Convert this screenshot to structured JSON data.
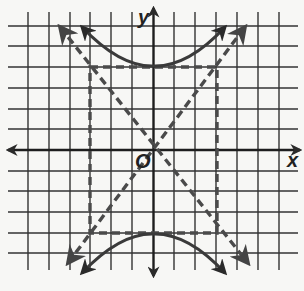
{
  "figure": {
    "type": "hyperbola-graph",
    "axis_labels": {
      "x": "x",
      "y": "y",
      "origin": "O"
    },
    "grid": {
      "x_range": [
        -6,
        7
      ],
      "y_range": [
        -6,
        6
      ],
      "unit": 1
    },
    "hyperbola": {
      "equation": "y^2/16 - x^2/9 = 1",
      "a": 4,
      "b": 3,
      "vertices": [
        [
          0,
          4
        ],
        [
          0,
          -4
        ]
      ],
      "opens": "vertical"
    },
    "asymptotes": [
      "y = 4/3 x",
      "y = -4/3 x"
    ],
    "central_rectangle": {
      "x": [
        -3,
        3
      ],
      "y": [
        -4,
        4
      ]
    },
    "colors": {
      "grid": "#2b2b2b",
      "curve": "#3a3a3a",
      "dashed": "#4a4a4a",
      "background": "#f7f7f5"
    }
  }
}
